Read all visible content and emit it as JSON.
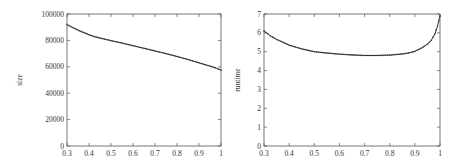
{
  "chart_data": [
    {
      "type": "line",
      "title": "",
      "xlabel": "",
      "ylabel": "size",
      "xlim": [
        0.3,
        1.0
      ],
      "ylim": [
        0,
        100000
      ],
      "xticks": [
        "0.3",
        "0.4",
        "0.5",
        "0.6",
        "0.7",
        "0.8",
        "0.9",
        "1"
      ],
      "yticks": [
        "0",
        "20000",
        "40000",
        "60000",
        "80000",
        "100000"
      ],
      "grid": false,
      "legend": null,
      "series": [
        {
          "name": "size",
          "x": [
            0.3,
            0.325,
            0.35,
            0.375,
            0.4,
            0.425,
            0.45,
            0.5,
            0.55,
            0.6,
            0.65,
            0.7,
            0.75,
            0.8,
            0.85,
            0.9,
            0.95,
            0.975,
            1.0
          ],
          "values": [
            92000,
            89800,
            87800,
            86000,
            84300,
            82800,
            81800,
            79800,
            78000,
            76000,
            74000,
            72000,
            70000,
            67800,
            65500,
            63000,
            60500,
            59200,
            57500
          ]
        }
      ]
    },
    {
      "type": "line",
      "title": "",
      "xlabel": "",
      "ylabel": "runtime",
      "xlim": [
        0.3,
        1.0
      ],
      "ylim": [
        0,
        7
      ],
      "xticks": [
        "0.3",
        "0.4",
        "0.5",
        "0.6",
        "0.7",
        "0.8",
        "0.9",
        "1"
      ],
      "yticks": [
        "0",
        "1",
        "2",
        "3",
        "4",
        "5",
        "6",
        "7"
      ],
      "grid": false,
      "legend": null,
      "series": [
        {
          "name": "runtime",
          "x": [
            0.3,
            0.325,
            0.35,
            0.375,
            0.4,
            0.45,
            0.5,
            0.55,
            0.6,
            0.65,
            0.7,
            0.75,
            0.8,
            0.85,
            0.875,
            0.9,
            0.925,
            0.95,
            0.965,
            0.98,
            0.99,
            1.0
          ],
          "values": [
            6.1,
            5.85,
            5.65,
            5.5,
            5.35,
            5.15,
            5.0,
            4.93,
            4.87,
            4.83,
            4.8,
            4.8,
            4.82,
            4.88,
            4.93,
            5.02,
            5.18,
            5.4,
            5.6,
            5.95,
            6.35,
            6.9
          ]
        }
      ]
    }
  ]
}
